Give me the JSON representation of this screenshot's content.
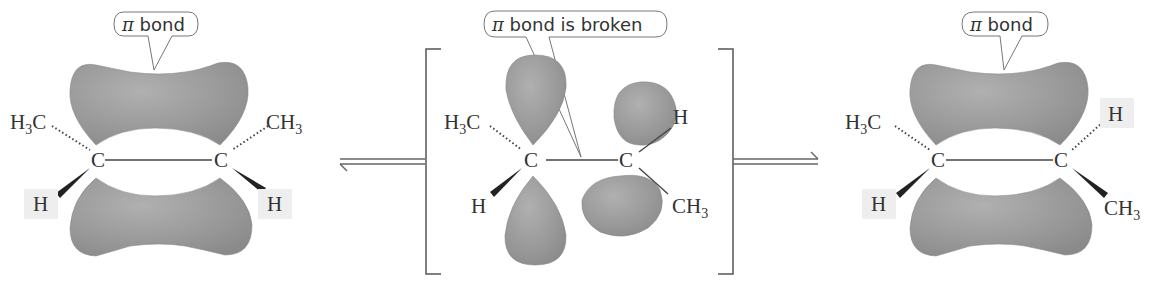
{
  "diagram": {
    "type": "reaction-scheme",
    "colors": {
      "orbital_lobe": "#9a9a9a",
      "label_highlight": "#eeeeee",
      "text": "#333333"
    },
    "arrows": [
      {
        "name": "equilibrium-arrow-1",
        "kind": "equilibrium"
      },
      {
        "name": "equilibrium-arrow-2",
        "kind": "equilibrium"
      }
    ],
    "structures": [
      {
        "name": "cis-2-butene",
        "callout": {
          "symbol": "π",
          "text": " bond"
        },
        "atoms": {
          "c_left": "C",
          "c_right": "C",
          "top_left": {
            "main": "H",
            "sub": "3",
            "tail": "C"
          },
          "top_right": {
            "main": "CH",
            "sub": "3",
            "tail": ""
          },
          "bottom_left": "H",
          "bottom_right": "H"
        }
      },
      {
        "name": "transition-state",
        "callout": {
          "symbol": "π",
          "text": " bond is broken"
        },
        "atoms": {
          "c_left": "C",
          "c_right": "C",
          "top_left": {
            "main": "H",
            "sub": "3",
            "tail": "C"
          },
          "bottom_left": "H",
          "top_right": "H",
          "bottom_right": {
            "main": "CH",
            "sub": "3",
            "tail": ""
          }
        }
      },
      {
        "name": "trans-2-butene",
        "callout": {
          "symbol": "π",
          "text": " bond"
        },
        "atoms": {
          "c_left": "C",
          "c_right": "C",
          "top_left": {
            "main": "H",
            "sub": "3",
            "tail": "C"
          },
          "top_right": "H",
          "bottom_left": "H",
          "bottom_right": {
            "main": "CH",
            "sub": "3",
            "tail": ""
          }
        }
      }
    ]
  }
}
